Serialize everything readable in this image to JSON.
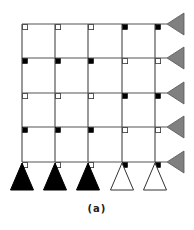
{
  "caption": "(a)",
  "grid": {
    "columns_x": [
      22,
      55,
      88,
      122,
      155
    ],
    "rows_y": [
      24,
      58,
      93,
      127,
      162
    ],
    "line_color": "#555555",
    "node_markers": [
      [
        "open",
        "open",
        "open",
        "filled",
        "filled"
      ],
      [
        "filled",
        "filled",
        "filled",
        "open",
        "open"
      ],
      [
        "open",
        "open",
        "open",
        "filled",
        "filled"
      ],
      [
        "filled",
        "filled",
        "filled",
        "open",
        "open"
      ],
      [
        "open",
        "open",
        "open",
        "filled",
        "filled"
      ]
    ]
  },
  "bottom_supports": [
    "filled",
    "filled",
    "filled",
    "open",
    "open"
  ],
  "right_supports": [
    "gray",
    "gray",
    "gray",
    "gray",
    "gray"
  ],
  "colors": {
    "filled": "#000000",
    "open": "#ffffff",
    "gray": "#808080",
    "stroke": "#333333"
  }
}
